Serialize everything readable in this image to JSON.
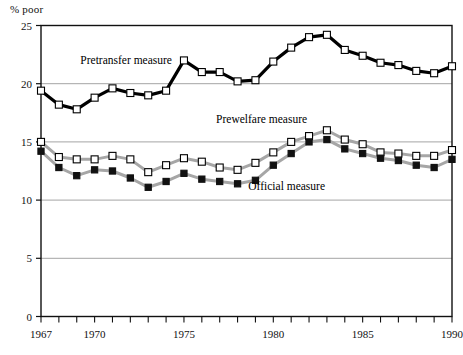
{
  "axis_label_y": "% poor",
  "chart_data": {
    "type": "line",
    "title": "",
    "subtitle": "",
    "xlabel": "",
    "ylabel": "% poor",
    "grid": true,
    "legend_position": "inline-annotations",
    "xlim": [
      1967,
      1990
    ],
    "ylim": [
      0,
      25
    ],
    "ytick_values": [
      0,
      5,
      10,
      15,
      20,
      25
    ],
    "ytick_labels": [
      "0",
      "5",
      "10",
      "15",
      "20",
      "25"
    ],
    "xtick_values": [
      1967,
      1968,
      1969,
      1970,
      1971,
      1972,
      1973,
      1974,
      1975,
      1976,
      1977,
      1978,
      1979,
      1980,
      1981,
      1982,
      1983,
      1984,
      1985,
      1986,
      1987,
      1988,
      1989,
      1990
    ],
    "xtick_labels_shown": [
      "1967",
      "1970",
      "1975",
      "1980",
      "1985",
      "1990"
    ],
    "xtick_labeled_values": [
      1967,
      1970,
      1975,
      1980,
      1985,
      1990
    ],
    "x": [
      1967,
      1968,
      1969,
      1970,
      1971,
      1972,
      1973,
      1974,
      1975,
      1976,
      1977,
      1978,
      1979,
      1980,
      1981,
      1982,
      1983,
      1984,
      1985,
      1986,
      1987,
      1988,
      1989,
      1990
    ],
    "series": [
      {
        "name": "Pretransfer measure",
        "marker": "open-square",
        "line_color": "#000000",
        "marker_fill": "#ffffff",
        "marker_edge": "#000000",
        "values": [
          19.4,
          18.2,
          17.8,
          18.8,
          19.6,
          19.2,
          19.0,
          19.4,
          22.0,
          21.0,
          21.0,
          20.2,
          20.3,
          21.9,
          23.1,
          24.0,
          24.2,
          22.9,
          22.4,
          21.8,
          21.6,
          21.1,
          20.9,
          21.5
        ]
      },
      {
        "name": "Prewelfare measure",
        "marker": "open-square",
        "line_color": "#a6a6a6",
        "marker_fill": "#ffffff",
        "marker_edge": "#000000",
        "values": [
          15.0,
          13.7,
          13.5,
          13.5,
          13.8,
          13.5,
          12.4,
          13.0,
          13.6,
          13.3,
          12.8,
          12.6,
          13.2,
          14.1,
          15.0,
          15.5,
          16.0,
          15.2,
          14.8,
          14.1,
          14.0,
          13.8,
          13.8,
          14.3
        ]
      },
      {
        "name": "Official measure",
        "marker": "filled-square",
        "line_color": "#a6a6a6",
        "marker_fill": "#111111",
        "marker_edge": "#111111",
        "values": [
          14.2,
          12.8,
          12.1,
          12.6,
          12.5,
          11.9,
          11.1,
          11.6,
          12.3,
          11.8,
          11.6,
          11.4,
          11.7,
          13.0,
          14.0,
          15.0,
          15.2,
          14.4,
          14.0,
          13.6,
          13.4,
          13.0,
          12.8,
          13.5
        ]
      }
    ],
    "annotations": [
      {
        "text": "Pretransfer measure",
        "x": 1969.2,
        "y": 21.7,
        "anchor": "start"
      },
      {
        "text": "Prewelfare measure",
        "x": 1976.8,
        "y": 16.6,
        "anchor": "start"
      },
      {
        "text": "Official measure",
        "x": 1978.6,
        "y": 10.9,
        "anchor": "start"
      }
    ]
  }
}
